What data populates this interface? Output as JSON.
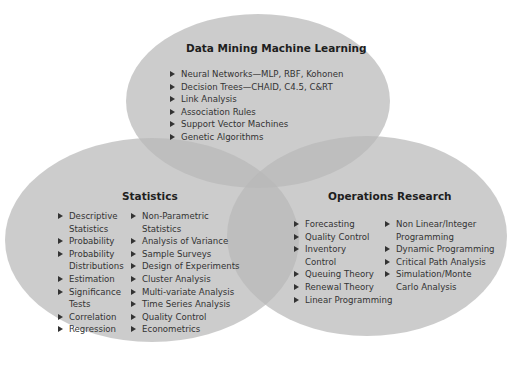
{
  "diagram": {
    "type": "venn",
    "colors": {
      "circle_fill": "#bdbdbd",
      "text": "#2a2a2a",
      "background": "#ffffff"
    },
    "circles": [
      {
        "id": "data-mining",
        "title": "Data Mining Machine Learning",
        "items": [
          "Neural Networks—MLP, RBF, Kohonen",
          "Decision Trees—CHAID, C4.5, C&RT",
          "Link Analysis",
          "Association Rules",
          "Support Vector Machines",
          "Genetic Algorithms"
        ]
      },
      {
        "id": "statistics",
        "title": "Statistics",
        "columns": [
          [
            "Descriptive Statistics",
            "Probability",
            "Probability Distributions",
            "Estimation",
            "Significance Tests",
            "Correlation",
            "Regression"
          ],
          [
            "Non-Parametric Statistics",
            "Analysis of Variance",
            "Sample Surveys",
            "Design of Experiments",
            "Cluster Analysis",
            "Multi-variate Analysis",
            "Time Series Analysis",
            "Quality Control",
            "Econometrics"
          ]
        ]
      },
      {
        "id": "operations-research",
        "title": "Operations Research",
        "columns": [
          [
            "Forecasting",
            "Quality Control",
            "Inventory Control",
            "Queuing Theory",
            "Renewal Theory",
            "Linear Programming"
          ],
          [
            "Non Linear/Integer Programming",
            "Dynamic Programming",
            "Critical Path Analysis",
            "Simulation/Monte Carlo Analysis"
          ]
        ]
      }
    ]
  }
}
